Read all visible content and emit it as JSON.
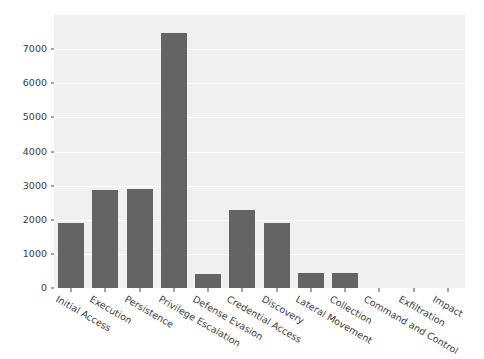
{
  "chart_data": {
    "type": "bar",
    "title": "",
    "subtitle": "",
    "xlabel": "",
    "ylabel": "",
    "categories": [
      "Initial Access",
      "Execution",
      "Persistence",
      "Privilege Escalation",
      "Defense Evasion",
      "Credential Access",
      "Discovery",
      "Lateral Movement",
      "Collection",
      "Command and Control",
      "Exfiltration",
      "Impact"
    ],
    "values": [
      1900,
      2880,
      2910,
      7480,
      400,
      2300,
      1900,
      430,
      430,
      0,
      0,
      0
    ],
    "yticks": [
      0,
      1000,
      2000,
      3000,
      4000,
      5000,
      6000,
      7000
    ],
    "ytick_labels": [
      "0",
      "1000",
      "2000",
      "3000",
      "4000",
      "5000",
      "6000",
      "7000"
    ],
    "ylim": [
      0,
      8000
    ],
    "xtick_rotation": 30,
    "grid": true,
    "legend": null,
    "bar_color": "#646464",
    "plot_background": "#f0f0f0",
    "gridline_color": "#ffffff",
    "figure_background": "#ffffff",
    "tick_label_color": "#3b3b3b"
  }
}
